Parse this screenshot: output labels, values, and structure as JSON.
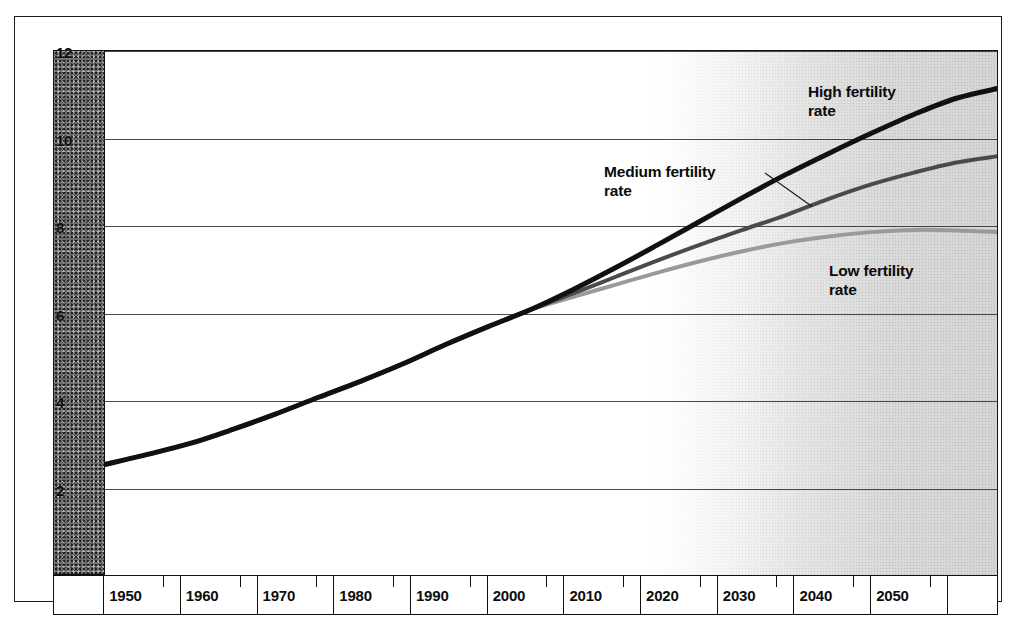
{
  "chart_data": {
    "type": "line",
    "title": "",
    "subtitle": "",
    "xlabel": "",
    "ylabel": "",
    "xlim": [
      1950,
      2055
    ],
    "ylim": [
      0,
      12
    ],
    "grid": true,
    "legend_position": "inline-annotations",
    "y_ticks": [
      "12",
      "10",
      "8",
      "6",
      "4",
      "2"
    ],
    "y_tick_values": [
      12,
      10,
      8,
      6,
      4,
      2
    ],
    "x_ticks": [
      "1950",
      "1960",
      "1970",
      "1980",
      "1990",
      "2000",
      "2010",
      "2020",
      "2030",
      "2040",
      "2050"
    ],
    "x_tick_values": [
      1950,
      1960,
      1970,
      1980,
      1990,
      2000,
      2010,
      2020,
      2030,
      2040,
      2050
    ],
    "annotations": [
      {
        "name": "high-fertility-label",
        "line1": "High fertility",
        "line2": "rate"
      },
      {
        "name": "medium-fertility-label",
        "line1": "Medium fertility",
        "line2": "rate"
      },
      {
        "name": "low-fertility-label",
        "line1": "Low fertility",
        "line2": "rate"
      }
    ],
    "projection_starts": 2000,
    "series": [
      {
        "name": "High fertility rate",
        "color": "#111111",
        "width": 5,
        "x": [
          1950,
          1955,
          1960,
          1965,
          1970,
          1975,
          1980,
          1985,
          1990,
          1995,
          2000,
          2005,
          2010,
          2015,
          2020,
          2025,
          2030,
          2035,
          2040,
          2045,
          2050,
          2055
        ],
        "values": [
          2.55,
          2.78,
          3.03,
          3.35,
          3.7,
          4.08,
          4.45,
          4.85,
          5.29,
          5.7,
          6.09,
          6.55,
          7.05,
          7.58,
          8.12,
          8.66,
          9.18,
          9.66,
          10.12,
          10.55,
          10.92,
          11.15
        ]
      },
      {
        "name": "Medium fertility rate",
        "color": "#4a4a4a",
        "width": 4,
        "x": [
          1950,
          1955,
          1960,
          1965,
          1970,
          1975,
          1980,
          1985,
          1990,
          1995,
          2000,
          2005,
          2010,
          2015,
          2020,
          2025,
          2030,
          2035,
          2040,
          2045,
          2050,
          2055
        ],
        "values": [
          2.55,
          2.78,
          3.03,
          3.35,
          3.7,
          4.08,
          4.45,
          4.85,
          5.29,
          5.7,
          6.09,
          6.46,
          6.84,
          7.22,
          7.58,
          7.92,
          8.25,
          8.62,
          8.95,
          9.22,
          9.45,
          9.6
        ]
      },
      {
        "name": "Low fertility rate",
        "color": "#9a9a9a",
        "width": 4,
        "x": [
          1950,
          1955,
          1960,
          1965,
          1970,
          1975,
          1980,
          1985,
          1990,
          1995,
          2000,
          2005,
          2010,
          2015,
          2020,
          2025,
          2030,
          2035,
          2040,
          2045,
          2050,
          2055
        ],
        "values": [
          2.55,
          2.78,
          3.03,
          3.35,
          3.7,
          4.08,
          4.45,
          4.85,
          5.29,
          5.7,
          6.09,
          6.38,
          6.66,
          6.94,
          7.2,
          7.43,
          7.62,
          7.76,
          7.86,
          7.91,
          7.9,
          7.86
        ]
      }
    ],
    "leader_line": {
      "name": "medium-label-leader",
      "from_label": "Medium fertility rate",
      "to_series": "Medium fertility rate"
    }
  }
}
